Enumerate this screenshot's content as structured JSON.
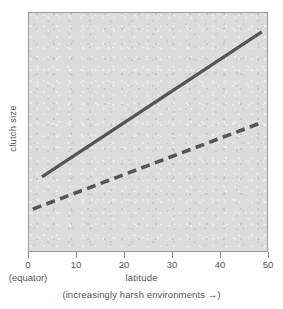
{
  "chart_data": {
    "type": "line",
    "title": "",
    "xlabel": "latitude",
    "ylabel": "clutch size",
    "xlabel_sub": "(increasingly harsh environments →)",
    "origin_note": "(equator)",
    "xlim": [
      0,
      50
    ],
    "ylim": [
      0,
      1
    ],
    "xticks": [
      0,
      10,
      20,
      30,
      40,
      50
    ],
    "xtick_labels": [
      "0",
      "10",
      "20",
      "30",
      "40",
      "50"
    ],
    "yticks": [],
    "ytick_labels": [],
    "grid": false,
    "legend": "none",
    "panel_color": "#dcdcdc",
    "line_color": "#555555",
    "series": [
      {
        "name": "solid-trend",
        "style": "solid",
        "x": [
          2.7,
          48.5
        ],
        "y": [
          0.317,
          0.921
        ]
      },
      {
        "name": "dashed-trend",
        "style": "dashed",
        "x": [
          0.8,
          48.8
        ],
        "y": [
          0.183,
          0.546
        ]
      }
    ]
  },
  "axes": {
    "y_title": "clutch size",
    "x_title": "latitude",
    "x_caption": "(increasingly harsh environments →)",
    "equator_label": "(equator)",
    "x_tick_labels": [
      "0",
      "10",
      "20",
      "30",
      "40",
      "50"
    ]
  }
}
